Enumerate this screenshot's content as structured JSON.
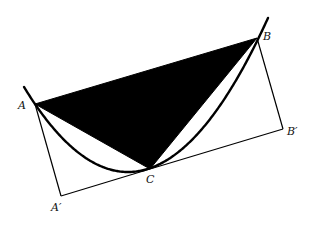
{
  "diagram": {
    "colors": {
      "background": "#ffffff",
      "fill": "#000000",
      "stroke": "#000000"
    },
    "points": {
      "A": [
        35,
        104
      ],
      "B": [
        257,
        38
      ],
      "C": [
        150,
        169
      ],
      "A_prime": [
        61,
        196
      ],
      "B_prime": [
        283,
        129
      ]
    },
    "parabola": {
      "vertex": [
        128,
        172
      ],
      "a": 0.00786,
      "x_start": 24,
      "x_end": 268,
      "stroke_width": 2.4
    },
    "lines": [
      {
        "from": "A",
        "to": "A_prime"
      },
      {
        "from": "A_prime",
        "to": "C"
      },
      {
        "from": "C",
        "to": "B_prime"
      },
      {
        "from": "B_prime",
        "to": "B"
      }
    ],
    "labels": {
      "A": "A",
      "B": "B",
      "C": "C",
      "A_prime": "A′",
      "B_prime": "B′"
    },
    "label_positions": {
      "A": [
        18,
        100
      ],
      "B": [
        263,
        31
      ],
      "C": [
        146,
        174
      ],
      "A_prime": [
        51,
        202
      ],
      "B_prime": [
        287,
        126
      ]
    }
  }
}
